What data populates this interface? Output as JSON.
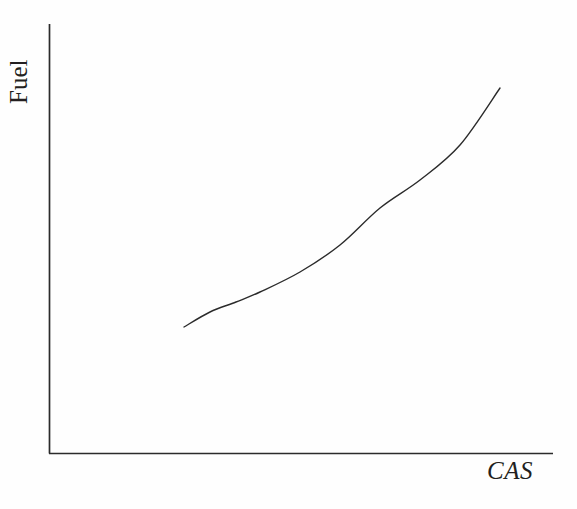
{
  "chart_data": {
    "type": "line",
    "title": "",
    "xlabel": "CAS",
    "ylabel": "Fuel",
    "grid": false,
    "legend": null,
    "axes": {
      "x_ticks": [],
      "y_ticks": [],
      "x_tick_labels": [],
      "y_tick_labels": [],
      "xlim": [
        0,
        1
      ],
      "ylim": [
        0,
        1
      ],
      "arrowheads": false,
      "style": "open-L"
    },
    "series": [
      {
        "name": "fuel-vs-cas",
        "color": "#2b2b2b",
        "line_width": 1.4,
        "x": [
          0.268,
          0.319,
          0.37,
          0.419,
          0.498,
          0.577,
          0.656,
          0.735,
          0.814,
          0.893,
          0.897
        ],
        "y": [
          0.294,
          0.333,
          0.372,
          0.408,
          0.469,
          0.535,
          0.606,
          0.684,
          0.768,
          0.856,
          0.861
        ],
        "points_px": [
          [
            184,
            327
          ],
          [
            210,
            312
          ],
          [
            236,
            302
          ],
          [
            260,
            292
          ],
          [
            300,
            272
          ],
          [
            340,
            245
          ],
          [
            380,
            208
          ],
          [
            420,
            180
          ],
          [
            460,
            145
          ],
          [
            500,
            88
          ]
        ]
      }
    ]
  },
  "labels": {
    "y_axis": "Fuel",
    "x_axis": "CAS"
  },
  "colors": {
    "background": "#fefefe",
    "axis": "#2b2b2b",
    "curve": "#2b2b2b",
    "text": "#231f20"
  }
}
